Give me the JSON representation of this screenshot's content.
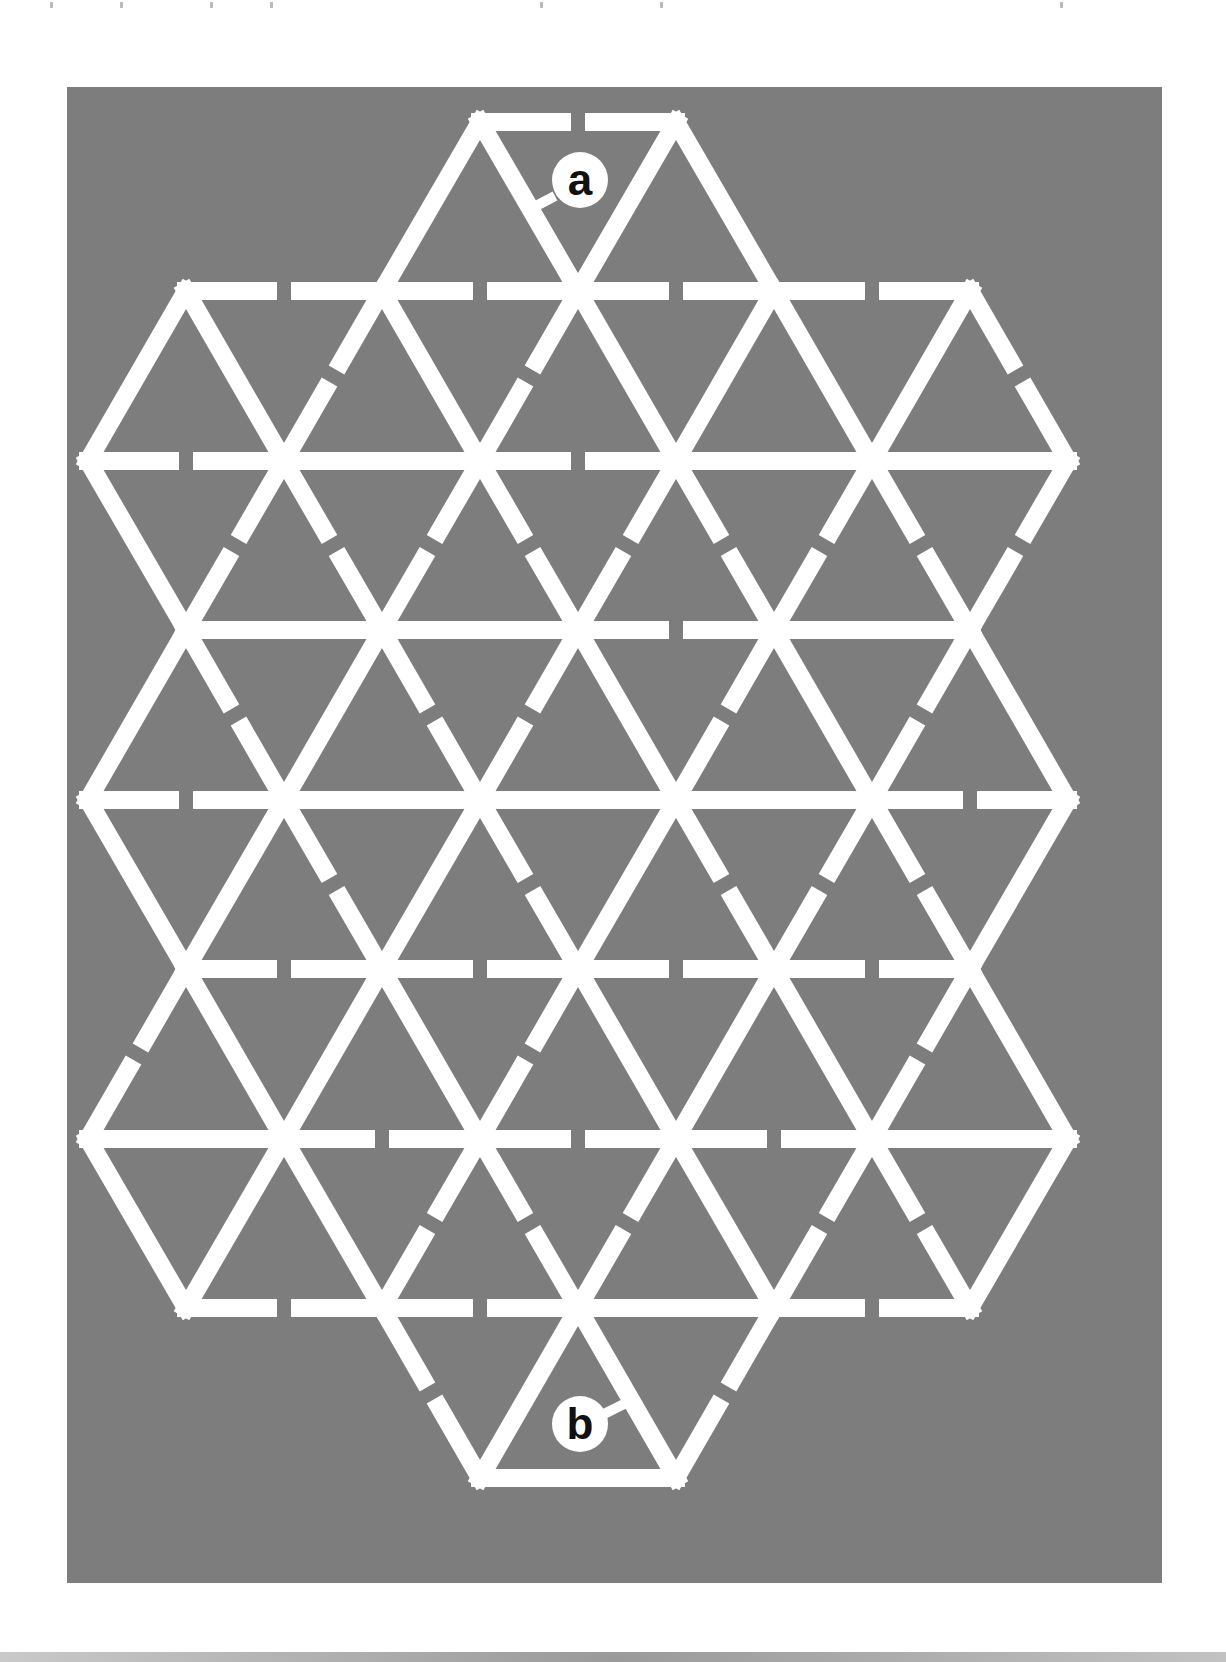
{
  "puzzle": {
    "type": "triangular-grid maze",
    "start_label": "a",
    "end_label": "b",
    "colors": {
      "background": "#7d7d7d",
      "walls": "#ffffff",
      "page": "#ffffff",
      "marker_text": "#111111"
    },
    "geometry": {
      "side": 196,
      "row_height": 169.5,
      "top_y": 122,
      "wall_width": 18,
      "gap": 14
    },
    "rows": [
      {
        "y": 122,
        "x": [
          480,
          676
        ]
      },
      {
        "y": 291,
        "x": [
          186,
          382,
          578,
          774,
          970
        ]
      },
      {
        "y": 461,
        "x": [
          88,
          284,
          480,
          676,
          872,
          1068
        ]
      },
      {
        "y": 630,
        "x": [
          186,
          382,
          578,
          774,
          970
        ]
      },
      {
        "y": 800,
        "x": [
          88,
          284,
          480,
          676,
          872,
          1068
        ]
      },
      {
        "y": 969,
        "x": [
          186,
          382,
          578,
          774,
          970
        ]
      },
      {
        "y": 1139,
        "x": [
          88,
          284,
          480,
          676,
          872,
          1068
        ]
      },
      {
        "y": 1308,
        "x": [
          186,
          382,
          578,
          774,
          970
        ]
      },
      {
        "y": 1478,
        "x": [
          480,
          676
        ]
      }
    ],
    "walls": [
      {
        "x1": 480,
        "y1": 122,
        "x2": 676,
        "y2": 122,
        "open": true
      },
      {
        "x1": 480,
        "y1": 122,
        "x2": 382,
        "y2": 291,
        "open": false
      },
      {
        "x1": 480,
        "y1": 122,
        "x2": 578,
        "y2": 291,
        "open": false
      },
      {
        "x1": 676,
        "y1": 122,
        "x2": 578,
        "y2": 291,
        "open": false
      },
      {
        "x1": 676,
        "y1": 122,
        "x2": 774,
        "y2": 291,
        "open": false
      },
      {
        "x1": 186,
        "y1": 291,
        "x2": 382,
        "y2": 291,
        "open": true
      },
      {
        "x1": 382,
        "y1": 291,
        "x2": 578,
        "y2": 291,
        "open": true
      },
      {
        "x1": 578,
        "y1": 291,
        "x2": 774,
        "y2": 291,
        "open": true
      },
      {
        "x1": 774,
        "y1": 291,
        "x2": 970,
        "y2": 291,
        "open": true
      },
      {
        "x1": 186,
        "y1": 291,
        "x2": 88,
        "y2": 461,
        "open": false
      },
      {
        "x1": 186,
        "y1": 291,
        "x2": 284,
        "y2": 461,
        "open": false
      },
      {
        "x1": 382,
        "y1": 291,
        "x2": 284,
        "y2": 461,
        "open": true
      },
      {
        "x1": 382,
        "y1": 291,
        "x2": 480,
        "y2": 461,
        "open": false
      },
      {
        "x1": 578,
        "y1": 291,
        "x2": 480,
        "y2": 461,
        "open": true
      },
      {
        "x1": 578,
        "y1": 291,
        "x2": 676,
        "y2": 461,
        "open": false
      },
      {
        "x1": 774,
        "y1": 291,
        "x2": 676,
        "y2": 461,
        "open": false
      },
      {
        "x1": 774,
        "y1": 291,
        "x2": 872,
        "y2": 461,
        "open": false
      },
      {
        "x1": 970,
        "y1": 291,
        "x2": 872,
        "y2": 461,
        "open": false
      },
      {
        "x1": 970,
        "y1": 291,
        "x2": 1068,
        "y2": 461,
        "open": true
      },
      {
        "x1": 88,
        "y1": 461,
        "x2": 284,
        "y2": 461,
        "open": true
      },
      {
        "x1": 284,
        "y1": 461,
        "x2": 480,
        "y2": 461,
        "open": false
      },
      {
        "x1": 480,
        "y1": 461,
        "x2": 676,
        "y2": 461,
        "open": true
      },
      {
        "x1": 676,
        "y1": 461,
        "x2": 872,
        "y2": 461,
        "open": false
      },
      {
        "x1": 872,
        "y1": 461,
        "x2": 1068,
        "y2": 461,
        "open": false
      },
      {
        "x1": 88,
        "y1": 461,
        "x2": 186,
        "y2": 630,
        "open": false
      },
      {
        "x1": 284,
        "y1": 461,
        "x2": 186,
        "y2": 630,
        "open": true
      },
      {
        "x1": 284,
        "y1": 461,
        "x2": 382,
        "y2": 630,
        "open": true
      },
      {
        "x1": 480,
        "y1": 461,
        "x2": 382,
        "y2": 630,
        "open": true
      },
      {
        "x1": 480,
        "y1": 461,
        "x2": 578,
        "y2": 630,
        "open": true
      },
      {
        "x1": 676,
        "y1": 461,
        "x2": 578,
        "y2": 630,
        "open": true
      },
      {
        "x1": 676,
        "y1": 461,
        "x2": 774,
        "y2": 630,
        "open": true
      },
      {
        "x1": 872,
        "y1": 461,
        "x2": 774,
        "y2": 630,
        "open": true
      },
      {
        "x1": 872,
        "y1": 461,
        "x2": 970,
        "y2": 630,
        "open": true
      },
      {
        "x1": 1068,
        "y1": 461,
        "x2": 970,
        "y2": 630,
        "open": true
      },
      {
        "x1": 186,
        "y1": 630,
        "x2": 382,
        "y2": 630,
        "open": false
      },
      {
        "x1": 382,
        "y1": 630,
        "x2": 578,
        "y2": 630,
        "open": false
      },
      {
        "x1": 578,
        "y1": 630,
        "x2": 774,
        "y2": 630,
        "open": true
      },
      {
        "x1": 774,
        "y1": 630,
        "x2": 970,
        "y2": 630,
        "open": false
      },
      {
        "x1": 186,
        "y1": 630,
        "x2": 88,
        "y2": 800,
        "open": false
      },
      {
        "x1": 186,
        "y1": 630,
        "x2": 284,
        "y2": 800,
        "open": true
      },
      {
        "x1": 382,
        "y1": 630,
        "x2": 284,
        "y2": 800,
        "open": false
      },
      {
        "x1": 382,
        "y1": 630,
        "x2": 480,
        "y2": 800,
        "open": true
      },
      {
        "x1": 578,
        "y1": 630,
        "x2": 480,
        "y2": 800,
        "open": true
      },
      {
        "x1": 578,
        "y1": 630,
        "x2": 676,
        "y2": 800,
        "open": false
      },
      {
        "x1": 774,
        "y1": 630,
        "x2": 676,
        "y2": 800,
        "open": true
      },
      {
        "x1": 774,
        "y1": 630,
        "x2": 872,
        "y2": 800,
        "open": false
      },
      {
        "x1": 970,
        "y1": 630,
        "x2": 872,
        "y2": 800,
        "open": true
      },
      {
        "x1": 970,
        "y1": 630,
        "x2": 1068,
        "y2": 800,
        "open": false
      },
      {
        "x1": 88,
        "y1": 800,
        "x2": 284,
        "y2": 800,
        "open": true
      },
      {
        "x1": 284,
        "y1": 800,
        "x2": 480,
        "y2": 800,
        "open": false
      },
      {
        "x1": 480,
        "y1": 800,
        "x2": 676,
        "y2": 800,
        "open": false
      },
      {
        "x1": 676,
        "y1": 800,
        "x2": 872,
        "y2": 800,
        "open": false
      },
      {
        "x1": 872,
        "y1": 800,
        "x2": 1068,
        "y2": 800,
        "open": true
      },
      {
        "x1": 88,
        "y1": 800,
        "x2": 186,
        "y2": 969,
        "open": false
      },
      {
        "x1": 284,
        "y1": 800,
        "x2": 186,
        "y2": 969,
        "open": false
      },
      {
        "x1": 284,
        "y1": 800,
        "x2": 382,
        "y2": 969,
        "open": true
      },
      {
        "x1": 480,
        "y1": 800,
        "x2": 382,
        "y2": 969,
        "open": false
      },
      {
        "x1": 480,
        "y1": 800,
        "x2": 578,
        "y2": 969,
        "open": true
      },
      {
        "x1": 676,
        "y1": 800,
        "x2": 578,
        "y2": 969,
        "open": false
      },
      {
        "x1": 676,
        "y1": 800,
        "x2": 774,
        "y2": 969,
        "open": true
      },
      {
        "x1": 872,
        "y1": 800,
        "x2": 774,
        "y2": 969,
        "open": true
      },
      {
        "x1": 872,
        "y1": 800,
        "x2": 970,
        "y2": 969,
        "open": true
      },
      {
        "x1": 1068,
        "y1": 800,
        "x2": 970,
        "y2": 969,
        "open": false
      },
      {
        "x1": 186,
        "y1": 969,
        "x2": 382,
        "y2": 969,
        "open": true
      },
      {
        "x1": 382,
        "y1": 969,
        "x2": 578,
        "y2": 969,
        "open": true
      },
      {
        "x1": 578,
        "y1": 969,
        "x2": 774,
        "y2": 969,
        "open": true
      },
      {
        "x1": 774,
        "y1": 969,
        "x2": 970,
        "y2": 969,
        "open": true
      },
      {
        "x1": 186,
        "y1": 969,
        "x2": 88,
        "y2": 1139,
        "open": true
      },
      {
        "x1": 186,
        "y1": 969,
        "x2": 284,
        "y2": 1139,
        "open": false
      },
      {
        "x1": 382,
        "y1": 969,
        "x2": 284,
        "y2": 1139,
        "open": false
      },
      {
        "x1": 382,
        "y1": 969,
        "x2": 480,
        "y2": 1139,
        "open": false
      },
      {
        "x1": 578,
        "y1": 969,
        "x2": 480,
        "y2": 1139,
        "open": true
      },
      {
        "x1": 578,
        "y1": 969,
        "x2": 676,
        "y2": 1139,
        "open": false
      },
      {
        "x1": 774,
        "y1": 969,
        "x2": 676,
        "y2": 1139,
        "open": false
      },
      {
        "x1": 774,
        "y1": 969,
        "x2": 872,
        "y2": 1139,
        "open": false
      },
      {
        "x1": 970,
        "y1": 969,
        "x2": 872,
        "y2": 1139,
        "open": true
      },
      {
        "x1": 970,
        "y1": 969,
        "x2": 1068,
        "y2": 1139,
        "open": false
      },
      {
        "x1": 88,
        "y1": 1139,
        "x2": 284,
        "y2": 1139,
        "open": false
      },
      {
        "x1": 284,
        "y1": 1139,
        "x2": 480,
        "y2": 1139,
        "open": true
      },
      {
        "x1": 480,
        "y1": 1139,
        "x2": 676,
        "y2": 1139,
        "open": true
      },
      {
        "x1": 676,
        "y1": 1139,
        "x2": 872,
        "y2": 1139,
        "open": true
      },
      {
        "x1": 872,
        "y1": 1139,
        "x2": 1068,
        "y2": 1139,
        "open": false
      },
      {
        "x1": 88,
        "y1": 1139,
        "x2": 186,
        "y2": 1308,
        "open": false
      },
      {
        "x1": 284,
        "y1": 1139,
        "x2": 186,
        "y2": 1308,
        "open": false
      },
      {
        "x1": 284,
        "y1": 1139,
        "x2": 382,
        "y2": 1308,
        "open": false
      },
      {
        "x1": 480,
        "y1": 1139,
        "x2": 382,
        "y2": 1308,
        "open": true
      },
      {
        "x1": 480,
        "y1": 1139,
        "x2": 578,
        "y2": 1308,
        "open": true
      },
      {
        "x1": 676,
        "y1": 1139,
        "x2": 578,
        "y2": 1308,
        "open": true
      },
      {
        "x1": 676,
        "y1": 1139,
        "x2": 774,
        "y2": 1308,
        "open": false
      },
      {
        "x1": 872,
        "y1": 1139,
        "x2": 774,
        "y2": 1308,
        "open": true
      },
      {
        "x1": 872,
        "y1": 1139,
        "x2": 970,
        "y2": 1308,
        "open": true
      },
      {
        "x1": 1068,
        "y1": 1139,
        "x2": 970,
        "y2": 1308,
        "open": false
      },
      {
        "x1": 186,
        "y1": 1308,
        "x2": 382,
        "y2": 1308,
        "open": true
      },
      {
        "x1": 382,
        "y1": 1308,
        "x2": 578,
        "y2": 1308,
        "open": true
      },
      {
        "x1": 578,
        "y1": 1308,
        "x2": 774,
        "y2": 1308,
        "open": false
      },
      {
        "x1": 774,
        "y1": 1308,
        "x2": 970,
        "y2": 1308,
        "open": true
      },
      {
        "x1": 382,
        "y1": 1308,
        "x2": 480,
        "y2": 1478,
        "open": true
      },
      {
        "x1": 578,
        "y1": 1308,
        "x2": 480,
        "y2": 1478,
        "open": false
      },
      {
        "x1": 578,
        "y1": 1308,
        "x2": 676,
        "y2": 1478,
        "open": false
      },
      {
        "x1": 774,
        "y1": 1308,
        "x2": 676,
        "y2": 1478,
        "open": true
      },
      {
        "x1": 480,
        "y1": 1478,
        "x2": 676,
        "y2": 1478,
        "open": false
      }
    ],
    "markers": [
      {
        "label": "a",
        "cx": 580,
        "cy": 180,
        "r": 28,
        "leader": {
          "x1": 555,
          "y1": 196,
          "x2": 536,
          "y2": 206
        }
      },
      {
        "label": "b",
        "cx": 580,
        "cy": 1424,
        "r": 28,
        "leader": {
          "x1": 604,
          "y1": 1414,
          "x2": 628,
          "y2": 1402
        }
      }
    ]
  }
}
